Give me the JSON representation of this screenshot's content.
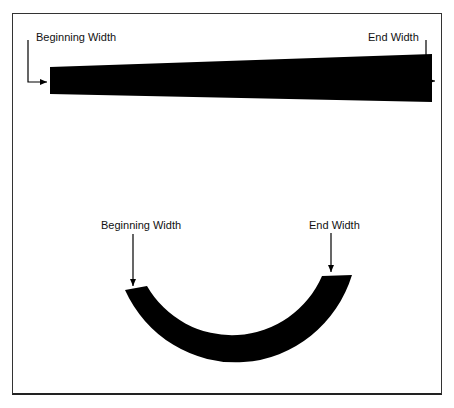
{
  "diagram": {
    "straight": {
      "begin_label": "Beginning Width",
      "end_label": "End Width"
    },
    "curved": {
      "begin_label": "Beginning Width",
      "end_label": "End Width"
    }
  },
  "colors": {
    "shape": "#000000",
    "frame": "#333333",
    "background": "#ffffff"
  }
}
